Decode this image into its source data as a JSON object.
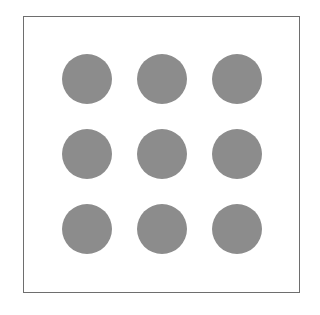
{
  "diagram": {
    "rows": 3,
    "cols": 3,
    "dot_color": "#8c8c8c",
    "frame_color": "#6e6e6e",
    "dots": [
      {
        "row": 0,
        "col": 0
      },
      {
        "row": 0,
        "col": 1
      },
      {
        "row": 0,
        "col": 2
      },
      {
        "row": 1,
        "col": 0
      },
      {
        "row": 1,
        "col": 1
      },
      {
        "row": 1,
        "col": 2
      },
      {
        "row": 2,
        "col": 0
      },
      {
        "row": 2,
        "col": 1
      },
      {
        "row": 2,
        "col": 2
      }
    ]
  }
}
